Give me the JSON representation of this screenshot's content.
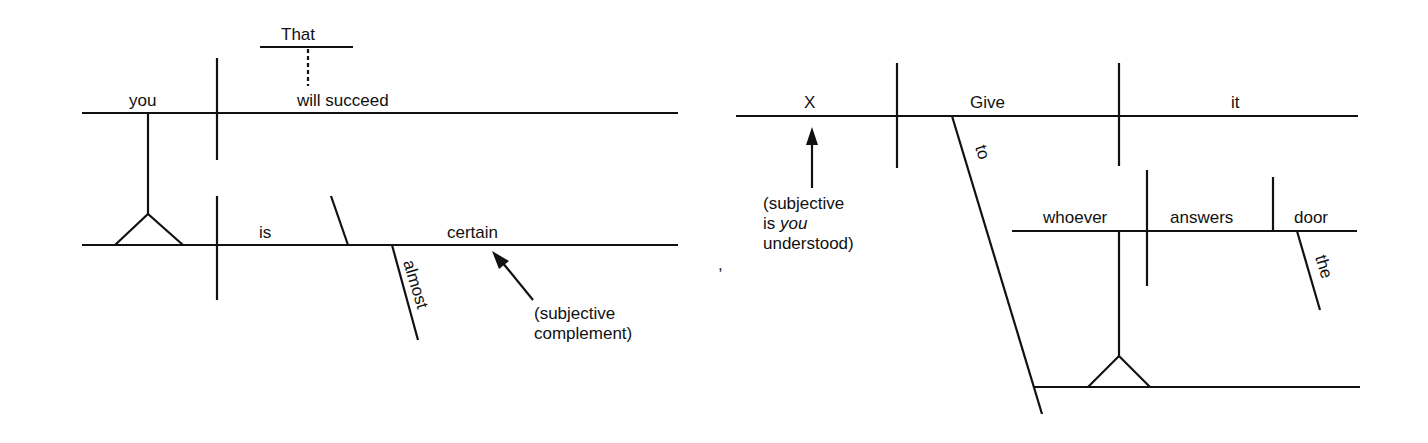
{
  "diagrams": [
    {
      "id": "left",
      "sentence": "That you will succeed is almost certain",
      "words": {
        "that": "That",
        "you": "you",
        "will_succeed": "will succeed",
        "is": "is",
        "certain": "certain",
        "almost": "almost"
      },
      "annotation": {
        "line1": "(subjective",
        "line2": "complement)"
      }
    },
    {
      "id": "right",
      "sentence": "Give it to whoever answers the door",
      "words": {
        "x": "X",
        "give": "Give",
        "it": "it",
        "to": "to",
        "whoever": "whoever",
        "answers": "answers",
        "door": "door",
        "the": "the"
      },
      "annotation": {
        "line1": "(subjective",
        "line2_pre": "is ",
        "line2_em": "you",
        "line3": "understood)"
      }
    }
  ],
  "stray_mark": ","
}
